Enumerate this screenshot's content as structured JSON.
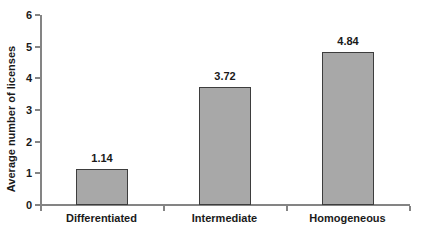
{
  "chart_data": {
    "type": "bar",
    "title": "",
    "xlabel": "",
    "ylabel": "Average number of licenses",
    "categories": [
      "Differentiated",
      "Intermediate",
      "Homogeneous"
    ],
    "values": [
      1.14,
      3.72,
      4.84
    ],
    "value_labels": [
      "1.14",
      "3.72",
      "4.84"
    ],
    "ylim": [
      0,
      6
    ],
    "ytick_labels": [
      "0",
      "1",
      "2",
      "3",
      "4",
      "5",
      "6"
    ],
    "yticks": [
      0,
      1,
      2,
      3,
      4,
      5,
      6
    ],
    "grid": false,
    "legend": false,
    "bar_fill_color": "#a8a8a8",
    "bar_border_color": "#3d3d3d",
    "axis_color": "#848484",
    "text_color": "#1a1a1a",
    "background_color": "#ffffff"
  },
  "axis": {
    "y_title": "Average number of licenses"
  },
  "ticks": {
    "y": [
      "0",
      "1",
      "2",
      "3",
      "4",
      "5",
      "6"
    ]
  },
  "bars": [
    {
      "label": "Differentiated",
      "value_label": "1.14"
    },
    {
      "label": "Intermediate",
      "value_label": "3.72"
    },
    {
      "label": "Homogeneous",
      "value_label": "4.84"
    }
  ]
}
